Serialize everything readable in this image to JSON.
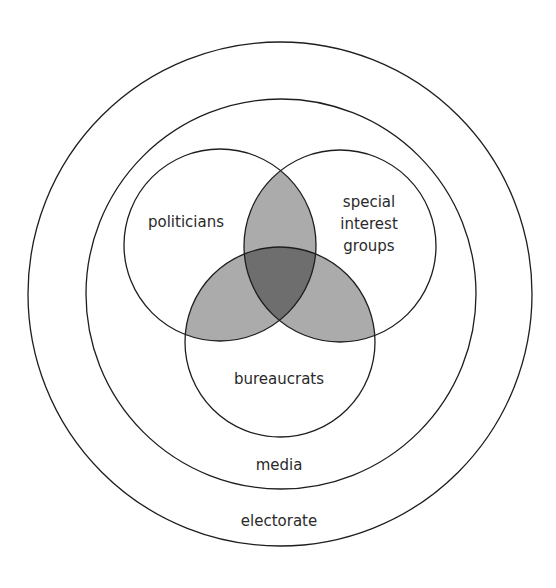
{
  "diagram": {
    "type": "nested-venn",
    "colors": {
      "background": "#ffffff",
      "stroke": "#1e1e1e",
      "pair_overlap": "#ababab",
      "triple_overlap": "#6e6e6e",
      "text": "#2a2a2a"
    },
    "rings": {
      "outer": {
        "label": "electorate",
        "cx": 280,
        "cy": 294,
        "r": 252
      },
      "inner": {
        "label": "media",
        "cx": 281,
        "cy": 294,
        "r": 195
      }
    },
    "sets": [
      {
        "id": "politicians",
        "label": "politicians",
        "cx": 220,
        "cy": 245,
        "r": 96
      },
      {
        "id": "special_interest_groups",
        "label_lines": [
          "special",
          "interest",
          "groups"
        ],
        "cx": 340,
        "cy": 246,
        "r": 96
      },
      {
        "id": "bureaucrats",
        "label": "bureaucrats",
        "cx": 280,
        "cy": 342,
        "r": 95
      }
    ]
  },
  "labels": {
    "politicians": "politicians",
    "sig_line1": "special",
    "sig_line2": "interest",
    "sig_line3": "groups",
    "bureaucrats": "bureaucrats",
    "media": "media",
    "electorate": "electorate"
  }
}
